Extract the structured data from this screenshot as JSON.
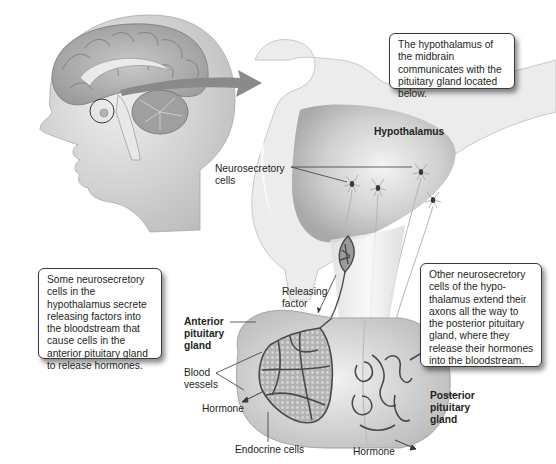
{
  "diagram": {
    "callouts": {
      "top_right": "The hypothalamus of the midbrain communicates with the pituitary gland located below.",
      "left": "Some neurosecretory cells in the hypothalamus secrete releasing factors into the bloodstream that cause cells in the anterior pituitary gland to release hormones.",
      "right": "Other neurosecretory cells of the hypo-thalamus extend their axons all the way to the posterior pituitary gland, where they release their hormones into the bloodstream."
    },
    "labels": {
      "hypothalamus": "Hypothalamus",
      "neurosecretory_cells_1": "Neurosecretory",
      "neurosecretory_cells_2": "cells",
      "releasing_factor_1": "Releasing",
      "releasing_factor_2": "factor",
      "anterior_1": "Anterior",
      "anterior_2": "pituitary",
      "anterior_3": "gland",
      "blood_vessels_1": "Blood",
      "blood_vessels_2": "vessels",
      "hormone_left": "Hormone",
      "endocrine_cells": "Endocrine cells",
      "hormone_right": "Hormone",
      "posterior_1": "Posterior",
      "posterior_2": "pituitary",
      "posterior_3": "gland"
    },
    "colors": {
      "arrow": "#8a8a8a",
      "tissue": "#e6e6e6",
      "vessel": "#4a4a4a",
      "text": "#231f20"
    }
  }
}
